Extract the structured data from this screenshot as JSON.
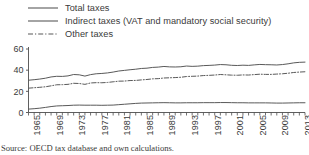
{
  "legend": {
    "position": "top",
    "items": [
      {
        "label": "Total taxes",
        "style": "solid",
        "color": "#595959"
      },
      {
        "label": "Indirect taxes (VAT and mandatory social security)",
        "style": "solid",
        "color": "#595959"
      },
      {
        "label": "Other taxes",
        "style": "dash-dot",
        "color": "#595959"
      }
    ]
  },
  "source": {
    "text": "Source: OECD tax database and own calculations."
  },
  "chart_data": {
    "type": "line",
    "title": "",
    "subtitle": "",
    "xlabel": "",
    "ylabel": "",
    "xlim": [
      1965,
      2014
    ],
    "ylim": [
      0,
      60
    ],
    "yticks": [
      0,
      20,
      40,
      60
    ],
    "grid": false,
    "legend_position": "top",
    "tick_labels_x": [
      "1965",
      "1969",
      "1973",
      "1977",
      "1981",
      "1985",
      "1989",
      "1993",
      "1997",
      "2001",
      "2005",
      "2009",
      "2013"
    ],
    "x": [
      1965,
      1966,
      1967,
      1968,
      1969,
      1970,
      1971,
      1972,
      1973,
      1974,
      1975,
      1976,
      1977,
      1978,
      1979,
      1980,
      1981,
      1982,
      1983,
      1984,
      1985,
      1986,
      1987,
      1988,
      1989,
      1990,
      1991,
      1992,
      1993,
      1994,
      1995,
      1996,
      1997,
      1998,
      1999,
      2000,
      2001,
      2002,
      2003,
      2004,
      2005,
      2006,
      2007,
      2008,
      2009,
      2010,
      2011,
      2012,
      2013,
      2014
    ],
    "series": [
      {
        "name": "Total taxes",
        "style": "solid",
        "color": "#595959",
        "values": [
          30.5,
          31.0,
          31.6,
          32.4,
          33.6,
          34.2,
          34.1,
          34.6,
          35.9,
          35.6,
          34.4,
          35.8,
          36.6,
          36.9,
          37.4,
          38.2,
          39.2,
          39.8,
          40.4,
          40.9,
          41.6,
          41.9,
          42.6,
          42.9,
          43.5,
          43.1,
          43.0,
          43.2,
          43.9,
          43.6,
          43.8,
          44.3,
          44.5,
          44.8,
          45.3,
          45.1,
          44.6,
          44.4,
          44.7,
          44.5,
          45.0,
          45.4,
          45.2,
          45.1,
          44.9,
          45.3,
          46.0,
          46.9,
          47.4,
          47.6
        ]
      },
      {
        "name": "Indirect taxes (VAT and mandatory social security)",
        "style": "dash-dot",
        "color": "#595959",
        "values": [
          23.0,
          23.4,
          23.8,
          24.3,
          25.2,
          26.2,
          26.3,
          26.6,
          27.6,
          27.4,
          26.6,
          27.9,
          28.2,
          28.1,
          28.4,
          29.0,
          29.6,
          29.7,
          30.2,
          30.3,
          30.8,
          31.2,
          31.8,
          32.0,
          32.6,
          32.8,
          33.0,
          33.3,
          34.0,
          34.2,
          34.4,
          34.9,
          35.1,
          35.4,
          35.9,
          35.6,
          35.3,
          35.2,
          35.5,
          35.4,
          35.8,
          36.2,
          36.0,
          36.0,
          36.3,
          36.6,
          37.1,
          37.8,
          38.2,
          38.5
        ]
      },
      {
        "name": "Other taxes",
        "style": "solid",
        "color": "#595959",
        "values": [
          3.2,
          3.6,
          4.1,
          4.8,
          5.6,
          6.2,
          6.4,
          6.6,
          6.9,
          7.0,
          6.9,
          6.9,
          6.9,
          6.8,
          6.9,
          7.0,
          7.4,
          7.8,
          8.2,
          8.6,
          8.9,
          9.0,
          9.1,
          9.2,
          9.3,
          9.2,
          9.1,
          9.1,
          9.2,
          9.2,
          9.2,
          9.3,
          9.3,
          9.3,
          9.4,
          9.4,
          9.3,
          9.2,
          9.2,
          9.1,
          9.1,
          9.1,
          9.1,
          9.0,
          8.9,
          8.9,
          9.0,
          9.1,
          9.2,
          9.2
        ]
      }
    ]
  }
}
